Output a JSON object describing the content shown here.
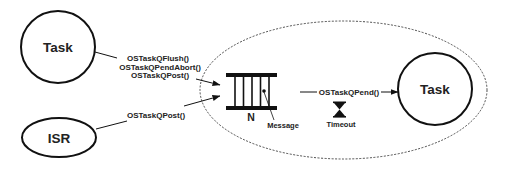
{
  "diagram": {
    "nodes": {
      "task_sender": {
        "label": "Task"
      },
      "isr": {
        "label": "ISR"
      },
      "task_receiver": {
        "label": "Task"
      }
    },
    "task_calls": [
      "OSTaskQFlush()",
      "OSTaskQPendAbort()",
      "OSTaskQPost()"
    ],
    "isr_calls": [
      "OSTaskQPost()"
    ],
    "pend_call": "OSTaskQPend()",
    "queue": {
      "size_label": "N",
      "message_label": "Message"
    },
    "timeout": {
      "label": "Timeout"
    },
    "icons": {
      "queue": "message-queue-icon",
      "timeout": "hourglass-icon"
    },
    "colors": {
      "stroke": "#111111",
      "text": "#222222",
      "background": "#ffffff"
    }
  }
}
